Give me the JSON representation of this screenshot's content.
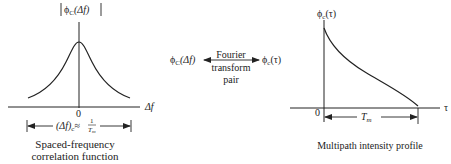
{
  "left_panel": {
    "y_label_func": "ϕ",
    "y_label_sub": "C",
    "y_label_arg": "(Δf)",
    "x_label": "Δf",
    "origin": "0",
    "bandwidth_lhs": "(Δf)",
    "bandwidth_sub": "c",
    "bandwidth_eq": "≈",
    "bandwidth_num": "1",
    "bandwidth_den": "T",
    "bandwidth_den_sub": "m",
    "caption_line1": "Spaced-frequency",
    "caption_line2": "correlation function"
  },
  "middle": {
    "left_func": "ϕ",
    "left_sub": "C",
    "left_arg": "(Δf)",
    "right_func": "ϕ",
    "right_sub": "c",
    "right_arg": "(τ)",
    "label_line1": "Fourier",
    "label_line2": "transform",
    "label_line3": "pair"
  },
  "right_panel": {
    "y_label_func": "ϕ",
    "y_label_sub": "c",
    "y_label_arg": "(τ)",
    "x_label": "τ",
    "origin": "0",
    "span_label": "T",
    "span_sub": "m",
    "caption": "Multipath intensity profile"
  },
  "colors": {
    "ink": "#222222",
    "background": "#ffffff"
  }
}
